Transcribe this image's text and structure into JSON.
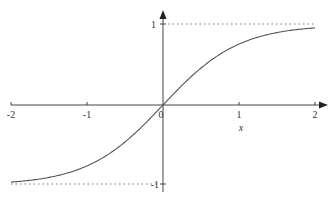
{
  "chart_data": {
    "type": "line",
    "title": "",
    "xlabel": "x",
    "ylabel": "",
    "xlim": [
      -2,
      2
    ],
    "ylim": [
      -1,
      1
    ],
    "x_ticks": [
      "-2",
      "-1",
      "0",
      "1",
      "2"
    ],
    "y_ticks": [
      "1",
      "-1"
    ],
    "grid": false,
    "legend": null,
    "series": [
      {
        "name": "tanh(x)",
        "x": [
          -2,
          -1.5,
          -1,
          -0.5,
          0,
          0.5,
          1,
          1.5,
          2
        ],
        "values": [
          -0.96,
          -0.91,
          -0.76,
          -0.46,
          0,
          0.46,
          0.76,
          0.91,
          0.96
        ]
      }
    ],
    "asymptotes": [
      {
        "y": 1,
        "style": "dotted"
      },
      {
        "y": -1,
        "style": "dotted"
      }
    ]
  },
  "labels": {
    "x_neg2": "-2",
    "x_neg1": "-1",
    "x_0": "0",
    "x_1": "1",
    "x_2": "2",
    "y_1": "1",
    "y_neg1": "-1",
    "x_axis": "x"
  },
  "colors": {
    "curve": "#555555",
    "axis": "#444444",
    "asymptote": "#777777"
  }
}
